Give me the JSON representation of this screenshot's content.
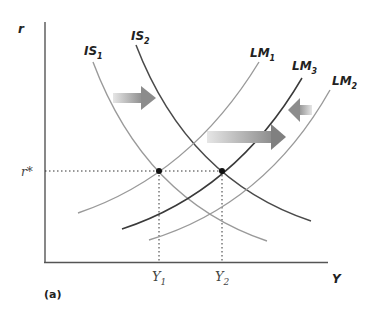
{
  "diagram": {
    "panel_label": "(a)",
    "axes": {
      "y_label": "r",
      "x_label": "Y",
      "r_star_label": "r*"
    },
    "tick_labels": {
      "y1": {
        "base": "Y",
        "sub": "1"
      },
      "y2": {
        "base": "Y",
        "sub": "2"
      }
    },
    "curves": {
      "is1": {
        "base": "IS",
        "sub": "1",
        "color": "#9a9a9a"
      },
      "is2": {
        "base": "IS",
        "sub": "2",
        "color": "#4a4a4a"
      },
      "lm1": {
        "base": "LM",
        "sub": "1",
        "color": "#9a9a9a"
      },
      "lm3": {
        "base": "LM",
        "sub": "3",
        "color": "#3a3a3a"
      },
      "lm2": {
        "base": "LM",
        "sub": "2",
        "color": "#9a9a9a"
      }
    },
    "arrows": [
      {
        "name": "is-shift-right",
        "direction": "right"
      },
      {
        "name": "lm-shift-right",
        "direction": "right"
      },
      {
        "name": "lm-shift-left",
        "direction": "left"
      }
    ],
    "equilibria": [
      {
        "name": "initial",
        "x_label": "Y1",
        "y_label": "r*"
      },
      {
        "name": "final",
        "x_label": "Y2",
        "y_label": "r*"
      }
    ]
  }
}
